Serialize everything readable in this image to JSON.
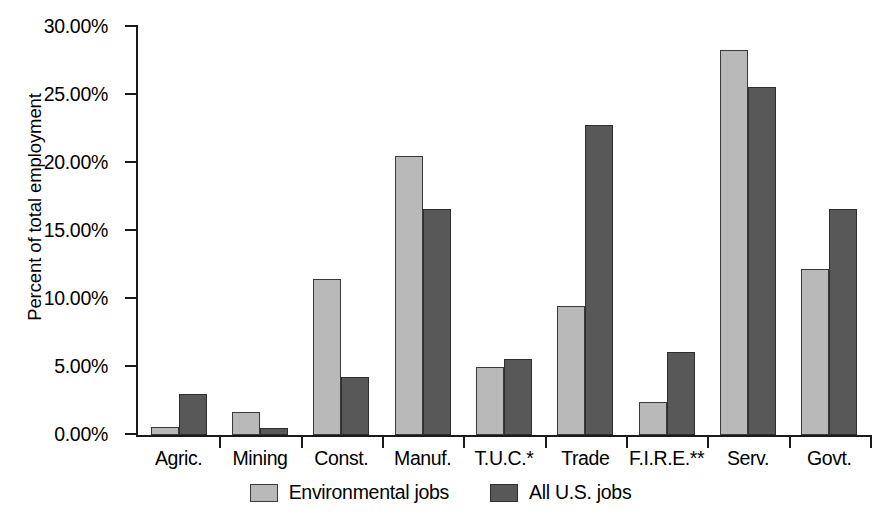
{
  "chart_data": {
    "type": "bar",
    "title": "",
    "xlabel": "",
    "ylabel": "Percent of total employment",
    "ylim": [
      0,
      30
    ],
    "ytick_values": [
      0,
      5,
      10,
      15,
      20,
      25,
      30
    ],
    "ytick_labels": [
      "0.00%",
      "5.00%",
      "10.00%",
      "15.00%",
      "20.00%",
      "25.00%",
      "30.00%"
    ],
    "grid": false,
    "legend_position": "bottom-center",
    "categories": [
      "Agric.",
      "Mining",
      "Const.",
      "Manuf.",
      "T.U.C.*",
      "Trade",
      "F.I.R.E.**",
      "Serv.",
      "Govt."
    ],
    "series": [
      {
        "name": "Environmental jobs",
        "color": "#b9b9b9",
        "values": [
          0.6,
          1.7,
          11.5,
          20.5,
          5.0,
          9.5,
          2.4,
          28.3,
          12.2
        ]
      },
      {
        "name": "All U.S. jobs",
        "color": "#585858",
        "values": [
          3.0,
          0.5,
          4.3,
          16.6,
          5.6,
          22.8,
          6.1,
          25.6,
          16.6
        ]
      }
    ]
  },
  "legend": {
    "entries": [
      {
        "label": "Environmental jobs"
      },
      {
        "label": "All U.S. jobs"
      }
    ]
  }
}
